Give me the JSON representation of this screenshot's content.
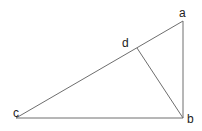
{
  "diagram": {
    "type": "geometry-triangle",
    "points": {
      "a": {
        "label": "a",
        "x": 183,
        "y": 21,
        "lx": 179,
        "ly": 17
      },
      "b": {
        "label": "b",
        "x": 183,
        "y": 118,
        "lx": 187,
        "ly": 123
      },
      "c": {
        "label": "c",
        "x": 16,
        "y": 118,
        "lx": 13,
        "ly": 117
      },
      "d": {
        "label": "d",
        "x": 137,
        "y": 48,
        "lx": 122,
        "ly": 47
      }
    },
    "segments": [
      [
        "c",
        "a"
      ],
      [
        "a",
        "b"
      ],
      [
        "c",
        "b"
      ],
      [
        "d",
        "b"
      ]
    ],
    "colors": {
      "line": "#6e6e6e",
      "text": "#222222",
      "background": "#ffffff"
    }
  }
}
